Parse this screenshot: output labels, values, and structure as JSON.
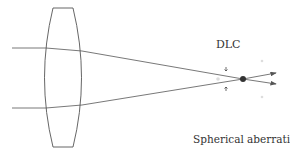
{
  "labels": {
    "dlc": "DLC",
    "caption": "Spherical aberration"
  },
  "colors": {
    "line": "#555555",
    "focus": "#333333",
    "faint": "#d8d8d8"
  },
  "diagram": {
    "lens": "biconvex lens",
    "rays": 2,
    "focus_point": "disk of least confusion"
  }
}
